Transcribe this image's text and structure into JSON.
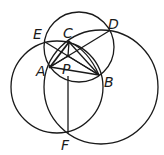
{
  "diagram": {
    "stroke_color": "#1a1a1a",
    "background": "#ffffff",
    "points": {
      "A": {
        "label": "A",
        "x": 50,
        "y": 67
      },
      "B": {
        "label": "B",
        "x": 99,
        "y": 75
      },
      "C": {
        "label": "C",
        "x": 69,
        "y": 42
      },
      "D": {
        "label": "D",
        "x": 109,
        "y": 31
      },
      "E": {
        "label": "E",
        "x": 45,
        "y": 42
      },
      "P": {
        "label": "P",
        "x": 68,
        "y": 60
      },
      "F": {
        "label": "F",
        "x": 68,
        "y": 133
      }
    },
    "circles": [
      {
        "name": "upper-circle",
        "cx": 79,
        "cy": 47,
        "r": 35
      },
      {
        "name": "left-circle",
        "cx": 57,
        "cy": 87,
        "r": 46
      },
      {
        "name": "right-circle",
        "cx": 101,
        "cy": 87,
        "r": 57
      }
    ],
    "segments": [
      [
        "A",
        "C"
      ],
      [
        "A",
        "B"
      ],
      [
        "C",
        "B"
      ],
      [
        "E",
        "B"
      ],
      [
        "A",
        "D"
      ],
      [
        "C",
        "P"
      ],
      [
        "A",
        "P"
      ],
      [
        "P",
        "B"
      ],
      [
        "P",
        "F"
      ]
    ]
  }
}
